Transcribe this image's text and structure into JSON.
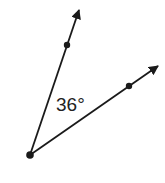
{
  "diagram": {
    "type": "angle",
    "angle_label": "36°",
    "angle_degrees": 36,
    "vertex": {
      "x": 30,
      "y": 155
    },
    "rays": [
      {
        "name": "upper-ray",
        "point": {
          "x": 67,
          "y": 45
        },
        "arrow_tip": {
          "x": 79,
          "y": 10
        }
      },
      {
        "name": "lower-ray",
        "point": {
          "x": 129,
          "y": 86
        },
        "arrow_tip": {
          "x": 158,
          "y": 66
        }
      }
    ],
    "colors": {
      "stroke": "#1a1a1a",
      "background": "#ffffff"
    }
  }
}
